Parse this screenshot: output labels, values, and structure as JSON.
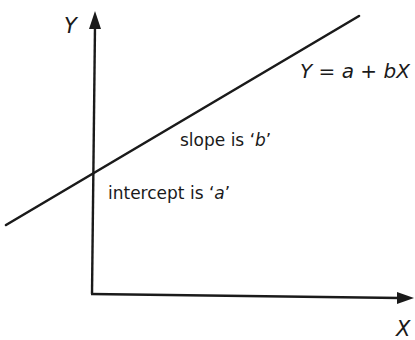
{
  "diagram": {
    "axes": {
      "y_label": "Y",
      "x_label": "X"
    },
    "line": {
      "equation": {
        "lhs": "Y",
        "eq": " = ",
        "a": "a",
        "plus": " + ",
        "b": "b",
        "x": "X"
      }
    },
    "annotations": {
      "slope": {
        "prefix": "slope is ",
        "open_quote": "‘",
        "var": "b",
        "close_quote": "’"
      },
      "intercept": {
        "prefix": "intercept is ",
        "open_quote": "‘",
        "var": "a",
        "close_quote": "’"
      }
    },
    "colors": {
      "ink": "#1a1a1a",
      "background": "#ffffff"
    }
  }
}
